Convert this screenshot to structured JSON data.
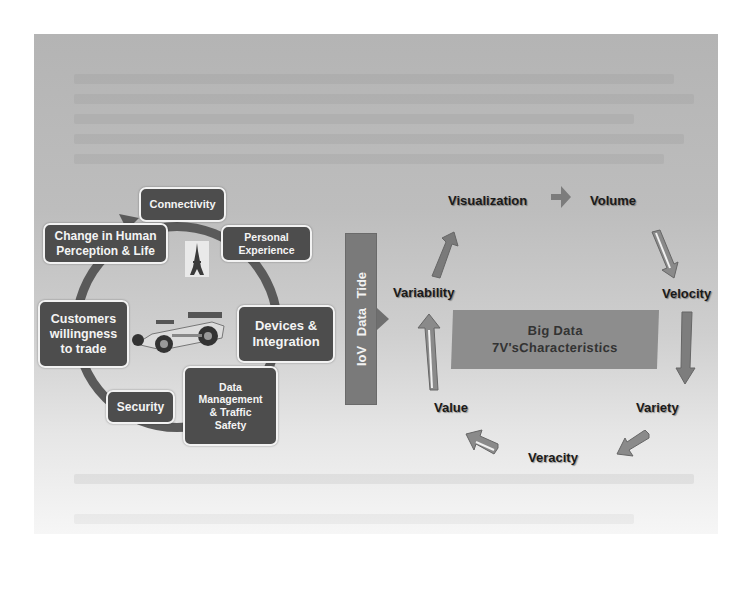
{
  "figure": {
    "left_cycle": {
      "items": [
        {
          "id": "connectivity",
          "label": "Connectivity"
        },
        {
          "id": "change-human",
          "label": "Change in Human Perception & Life"
        },
        {
          "id": "personal-experience",
          "label": "Personal Experience"
        },
        {
          "id": "customers",
          "label": "Customers willingness to trade"
        },
        {
          "id": "devices",
          "label": "Devices & Integration"
        },
        {
          "id": "security",
          "label": "Security"
        },
        {
          "id": "data-management",
          "label": "Data Management & Traffic Safety"
        }
      ],
      "center_images": [
        "eiffel-tower",
        "race-car"
      ]
    },
    "connector": {
      "label": "IoV  Data Tide"
    },
    "right_cycle": {
      "center_title_line1": "Big Data",
      "center_title_line2": "7V'sCharacteristics",
      "items": [
        {
          "id": "visualization",
          "label": "Visualization"
        },
        {
          "id": "volume",
          "label": "Volume"
        },
        {
          "id": "velocity",
          "label": "Velocity"
        },
        {
          "id": "variety",
          "label": "Variety"
        },
        {
          "id": "veracity",
          "label": "Veracity"
        },
        {
          "id": "value",
          "label": "Value"
        },
        {
          "id": "variability",
          "label": "Variability"
        }
      ]
    },
    "colors": {
      "box_fill": "#4d4d4d",
      "box_text": "#f4f4f4",
      "panel_bg": "#b8b8b8",
      "tide_fill": "#7a7a7a",
      "bigdata_fill": "#8d8d8d"
    }
  }
}
